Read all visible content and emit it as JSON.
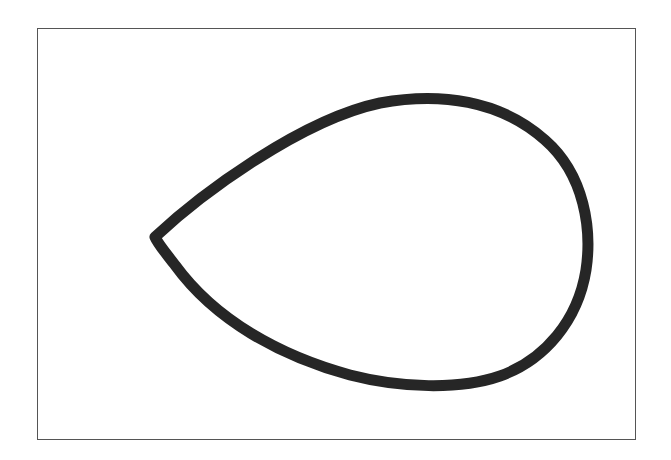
{
  "canvas": {
    "width": 671,
    "height": 460,
    "background": "#ffffff"
  },
  "frame": {
    "x": 37,
    "y": 28,
    "width": 599,
    "height": 412,
    "border_color": "#555555"
  },
  "shapes": [
    {
      "type": "teardrop",
      "description": "Hand-drawn teardrop / leaf outline pointing left",
      "stroke_color": "#262626",
      "stroke_width": 11,
      "fill": "none",
      "tip": [
        155,
        237
      ],
      "top_extreme": [
        420,
        100
      ],
      "right_extreme": [
        588,
        245
      ],
      "bottom_extreme": [
        445,
        384
      ]
    }
  ]
}
